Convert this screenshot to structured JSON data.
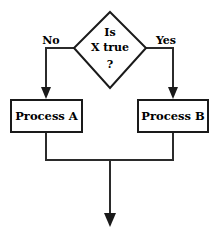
{
  "diagram": {
    "type": "flowchart",
    "background_color": "#ffffff",
    "line_color": "#2b2b2b",
    "text_color": "#000000",
    "nodes": [
      {
        "id": "decision",
        "shape": "diamond",
        "lines": [
          "Is",
          "X true",
          "?"
        ],
        "line1": "Is",
        "line2": "X true",
        "line3": "?"
      },
      {
        "id": "process-a",
        "shape": "rectangle",
        "label": "Process A"
      },
      {
        "id": "process-b",
        "shape": "rectangle",
        "label": "Process B"
      }
    ],
    "edges": [
      {
        "id": "edge-no",
        "from": "decision",
        "to": "process-a",
        "label": "No"
      },
      {
        "id": "edge-yes",
        "from": "decision",
        "to": "process-b",
        "label": "Yes"
      },
      {
        "id": "edge-merge",
        "from": "process-a,process-b",
        "to": "exit",
        "label": ""
      }
    ],
    "labels": {
      "no": "No",
      "yes": "Yes"
    }
  }
}
